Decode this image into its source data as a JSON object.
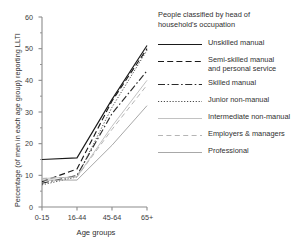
{
  "legend": {
    "title": "People classified by head of household's occupation",
    "entries": [
      {
        "label": "Unskilled manual",
        "style": "solid-dark",
        "color": "#1a1a1a"
      },
      {
        "label": "Semi-skilled manual\nand personal service",
        "style": "dashed-dark",
        "color": "#1a1a1a"
      },
      {
        "label": "Skilled manual",
        "style": "dash-dot",
        "color": "#2b2b2b"
      },
      {
        "label": "Junior non-manual",
        "style": "dotted",
        "color": "#4a4a4a"
      },
      {
        "label": "Intermediate non-manual",
        "style": "solid-light",
        "color": "#c2c2c2"
      },
      {
        "label": "Employers & managers",
        "style": "dashed-light",
        "color": "#b5b5b5"
      },
      {
        "label": "Professional",
        "style": "solid-mid",
        "color": "#a8a8a8"
      }
    ]
  },
  "chart_data": {
    "type": "line",
    "title": "",
    "xlabel": "Age groups",
    "ylabel": "Percentage (of men in each age group) reporting LLTI",
    "categories": [
      "0-15",
      "16-44",
      "45-64",
      "65+"
    ],
    "ylim": [
      0,
      60
    ],
    "ytick_labels": [
      "0",
      "10",
      "20",
      "30",
      "40",
      "50",
      "60"
    ],
    "ytick_values": [
      0,
      10,
      20,
      30,
      40,
      50,
      60
    ],
    "ytick_minor_values": [
      5,
      15,
      25,
      35,
      45,
      55
    ],
    "grid": false,
    "legend_position": "right",
    "series": [
      {
        "name": "Unskilled manual",
        "values": [
          15,
          15.5,
          34,
          51
        ]
      },
      {
        "name": "Semi-skilled manual and personal service",
        "values": [
          8,
          12,
          33.5,
          50
        ]
      },
      {
        "name": "Skilled manual",
        "values": [
          7.5,
          10,
          29.5,
          43
        ]
      },
      {
        "name": "Junior non-manual",
        "values": [
          7,
          9.5,
          31.5,
          49.5
        ]
      },
      {
        "name": "Intermediate non-manual",
        "values": [
          9,
          9.5,
          25.5,
          40
        ]
      },
      {
        "name": "Employers & managers",
        "values": [
          9,
          9.5,
          24.5,
          38.5
        ]
      },
      {
        "name": "Professional",
        "values": [
          8.5,
          8.5,
          19.5,
          32
        ]
      }
    ]
  }
}
